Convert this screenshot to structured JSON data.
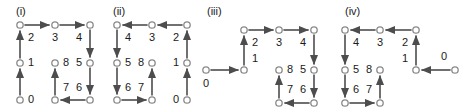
{
  "figure": {
    "type": "diagram",
    "node_radius": 3.2,
    "colors": {
      "edge": "#4d4d4d",
      "node_fill": "#ffffff",
      "node_stroke": "#8a8a8a",
      "label": "#1a1a1a",
      "background": "#ffffff"
    }
  },
  "panels": [
    {
      "id": "panel-i",
      "caption": "(i)",
      "caption_x": 16,
      "caption_y": 6,
      "origin_x": 0,
      "nodes": [
        {
          "name": "n-tl",
          "x": 20,
          "y": 25
        },
        {
          "name": "n-tm",
          "x": 55,
          "y": 25
        },
        {
          "name": "n-tr",
          "x": 90,
          "y": 25
        },
        {
          "name": "n-ml",
          "x": 20,
          "y": 63
        },
        {
          "name": "n-mm",
          "x": 55,
          "y": 63
        },
        {
          "name": "n-mr",
          "x": 90,
          "y": 63
        },
        {
          "name": "n-bl",
          "x": 20,
          "y": 100
        },
        {
          "name": "n-bm",
          "x": 55,
          "y": 100
        },
        {
          "name": "n-br",
          "x": 90,
          "y": 100
        }
      ],
      "edges": [
        {
          "label": "0",
          "x1": 20,
          "y1": 100,
          "x2": 20,
          "y2": 63,
          "lx": 31,
          "ly": 100
        },
        {
          "label": "1",
          "x1": 20,
          "y1": 63,
          "x2": 20,
          "y2": 25,
          "lx": 31,
          "ly": 63
        },
        {
          "label": "2",
          "x1": 20,
          "y1": 25,
          "x2": 55,
          "y2": 25,
          "lx": 31,
          "ly": 38
        },
        {
          "label": "3",
          "x1": 55,
          "y1": 25,
          "x2": 90,
          "y2": 25,
          "lx": 55,
          "ly": 38
        },
        {
          "label": "4",
          "x1": 90,
          "y1": 25,
          "x2": 90,
          "y2": 63,
          "lx": 79,
          "ly": 38
        },
        {
          "label": "5",
          "x1": 90,
          "y1": 63,
          "x2": 90,
          "y2": 100,
          "lx": 79,
          "ly": 63
        },
        {
          "label": "6",
          "x1": 90,
          "y1": 100,
          "x2": 55,
          "y2": 100,
          "lx": 79,
          "ly": 88
        },
        {
          "label": "7",
          "x1": 55,
          "y1": 100,
          "x2": 55,
          "y2": 63,
          "lx": 66,
          "ly": 88
        },
        {
          "label": "8",
          "x1": null,
          "y1": null,
          "x2": null,
          "y2": null,
          "lx": 66,
          "ly": 63
        }
      ],
      "terminal_nodes": [
        "n-mm"
      ]
    },
    {
      "id": "panel-ii",
      "caption": "(ii)",
      "caption_x": 113,
      "caption_y": 6,
      "origin_x": 0,
      "nodes": [
        {
          "name": "n-tl",
          "x": 117,
          "y": 25
        },
        {
          "name": "n-tm",
          "x": 152,
          "y": 25
        },
        {
          "name": "n-tr",
          "x": 187,
          "y": 25
        },
        {
          "name": "n-ml",
          "x": 117,
          "y": 63
        },
        {
          "name": "n-mm",
          "x": 152,
          "y": 63
        },
        {
          "name": "n-mr",
          "x": 187,
          "y": 63
        },
        {
          "name": "n-bl",
          "x": 117,
          "y": 100
        },
        {
          "name": "n-bm",
          "x": 152,
          "y": 100
        },
        {
          "name": "n-br",
          "x": 187,
          "y": 100
        }
      ],
      "edges": [
        {
          "label": "0",
          "x1": 187,
          "y1": 100,
          "x2": 187,
          "y2": 63,
          "lx": 176,
          "ly": 100
        },
        {
          "label": "1",
          "x1": 187,
          "y1": 63,
          "x2": 187,
          "y2": 25,
          "lx": 176,
          "ly": 63
        },
        {
          "label": "2",
          "x1": 187,
          "y1": 25,
          "x2": 152,
          "y2": 25,
          "lx": 176,
          "ly": 38
        },
        {
          "label": "3",
          "x1": 152,
          "y1": 25,
          "x2": 117,
          "y2": 25,
          "lx": 152,
          "ly": 38
        },
        {
          "label": "4",
          "x1": 117,
          "y1": 25,
          "x2": 117,
          "y2": 63,
          "lx": 128,
          "ly": 38
        },
        {
          "label": "5",
          "x1": 117,
          "y1": 63,
          "x2": 117,
          "y2": 100,
          "lx": 128,
          "ly": 63
        },
        {
          "label": "6",
          "x1": 117,
          "y1": 100,
          "x2": 152,
          "y2": 100,
          "lx": 128,
          "ly": 88
        },
        {
          "label": "7",
          "x1": 152,
          "y1": 100,
          "x2": 152,
          "y2": 63,
          "lx": 141,
          "ly": 88
        },
        {
          "label": "8",
          "x1": null,
          "y1": null,
          "x2": null,
          "y2": null,
          "lx": 141,
          "ly": 63
        }
      ],
      "terminal_nodes": [
        "n-mm"
      ]
    },
    {
      "id": "panel-iii",
      "caption": "(iii)",
      "caption_x": 207,
      "caption_y": 6,
      "origin_x": 0,
      "nodes": [
        {
          "name": "n-start",
          "x": 206,
          "y": 70
        },
        {
          "name": "n-tl",
          "x": 244,
          "y": 30
        },
        {
          "name": "n-tm",
          "x": 279,
          "y": 30
        },
        {
          "name": "n-tr",
          "x": 314,
          "y": 30
        },
        {
          "name": "n-ml",
          "x": 244,
          "y": 70
        },
        {
          "name": "n-mm",
          "x": 279,
          "y": 70
        },
        {
          "name": "n-mr",
          "x": 314,
          "y": 70
        },
        {
          "name": "n-bm",
          "x": 279,
          "y": 103
        },
        {
          "name": "n-br",
          "x": 314,
          "y": 103
        }
      ],
      "edges": [
        {
          "label": "0",
          "x1": 206,
          "y1": 70,
          "x2": 244,
          "y2": 70,
          "lx": 206,
          "ly": 84
        },
        {
          "label": "1",
          "x1": 244,
          "y1": 70,
          "x2": 244,
          "y2": 30,
          "lx": 255,
          "ly": 59
        },
        {
          "label": "2",
          "x1": null,
          "y1": null,
          "x2": null,
          "y2": null,
          "lx": 255,
          "ly": 43
        },
        {
          "label": "3",
          "x1": 244,
          "y1": 30,
          "x2": 279,
          "y2": 30,
          "lx": 279,
          "ly": 43
        },
        {
          "label": "4",
          "x1": 279,
          "y1": 30,
          "x2": 314,
          "y2": 30,
          "lx": 303,
          "ly": 43
        },
        {
          "label": "5",
          "x1": 314,
          "y1": 30,
          "x2": 314,
          "y2": 70,
          "lx": 303,
          "ly": 70
        },
        {
          "label": "6",
          "x1": 314,
          "y1": 70,
          "x2": 314,
          "y2": 103,
          "lx": 303,
          "ly": 90
        },
        {
          "label": "7",
          "x1": 314,
          "y1": 103,
          "x2": 279,
          "y2": 103,
          "lx": 290,
          "ly": 90
        },
        {
          "label": "8",
          "x1": 279,
          "y1": 103,
          "x2": 279,
          "y2": 70,
          "lx": 290,
          "ly": 70
        }
      ],
      "terminal_nodes": [
        "n-mm"
      ]
    },
    {
      "id": "panel-iv",
      "caption": "(iv)",
      "caption_x": 345,
      "caption_y": 6,
      "origin_x": 0,
      "nodes": [
        {
          "name": "n-start",
          "x": 455,
          "y": 70
        },
        {
          "name": "n-tl",
          "x": 345,
          "y": 30
        },
        {
          "name": "n-tm",
          "x": 380,
          "y": 30
        },
        {
          "name": "n-tr",
          "x": 416,
          "y": 30
        },
        {
          "name": "n-ml",
          "x": 345,
          "y": 70
        },
        {
          "name": "n-mm",
          "x": 380,
          "y": 70
        },
        {
          "name": "n-mr",
          "x": 416,
          "y": 70
        },
        {
          "name": "n-bl",
          "x": 345,
          "y": 103
        },
        {
          "name": "n-bm",
          "x": 380,
          "y": 103
        }
      ],
      "edges": [
        {
          "label": "0",
          "x1": 455,
          "y1": 70,
          "x2": 416,
          "y2": 70,
          "lx": 444,
          "ly": 57
        },
        {
          "label": "1",
          "x1": 416,
          "y1": 70,
          "x2": 416,
          "y2": 30,
          "lx": 405,
          "ly": 59
        },
        {
          "label": "2",
          "x1": null,
          "y1": null,
          "x2": null,
          "y2": null,
          "lx": 405,
          "ly": 43
        },
        {
          "label": "3",
          "x1": 416,
          "y1": 30,
          "x2": 380,
          "y2": 30,
          "lx": 380,
          "ly": 43
        },
        {
          "label": "4",
          "x1": 380,
          "y1": 30,
          "x2": 345,
          "y2": 30,
          "lx": 356,
          "ly": 43
        },
        {
          "label": "5",
          "x1": 345,
          "y1": 30,
          "x2": 345,
          "y2": 70,
          "lx": 356,
          "ly": 70
        },
        {
          "label": "6",
          "x1": 345,
          "y1": 70,
          "x2": 345,
          "y2": 103,
          "lx": 356,
          "ly": 90
        },
        {
          "label": "7",
          "x1": 345,
          "y1": 103,
          "x2": 380,
          "y2": 103,
          "lx": 369,
          "ly": 90
        },
        {
          "label": "8",
          "x1": 380,
          "y1": 103,
          "x2": 380,
          "y2": 70,
          "lx": 369,
          "ly": 70
        }
      ],
      "terminal_nodes": [
        "n-mm"
      ]
    }
  ]
}
